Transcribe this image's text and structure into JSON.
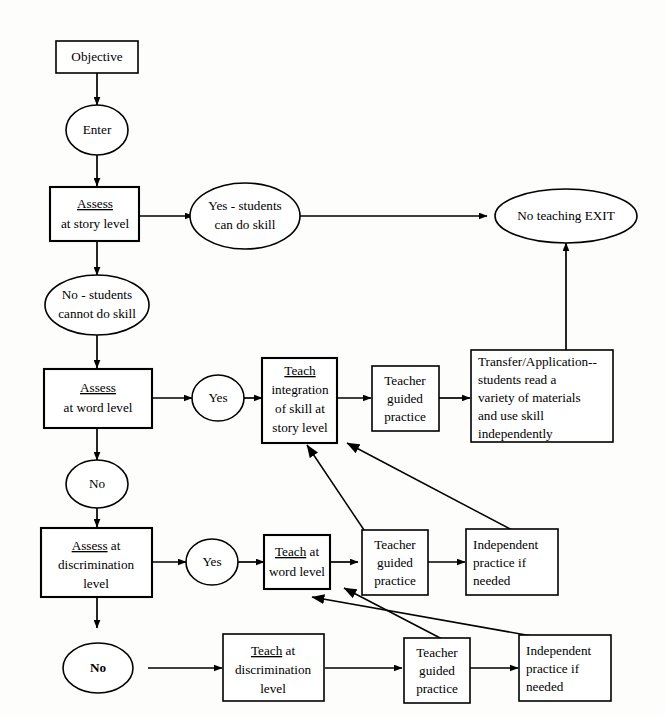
{
  "diagram": {
    "background_color": "#fdfdfb",
    "line_color": "#000000",
    "node_fill": "#ffffff"
  },
  "nodes": {
    "objective": {
      "label": "Objective",
      "shape": "rectangle"
    },
    "enter": {
      "label": "Enter",
      "shape": "ellipse"
    },
    "assess_story": {
      "line1": "Assess",
      "line2": "at story level",
      "shape": "rectangle",
      "underlined": "Assess"
    },
    "yes_students_can": {
      "line1": "Yes - students",
      "line2": "can do skill",
      "shape": "ellipse"
    },
    "no_teaching_exit": {
      "label": "No teaching EXIT",
      "shape": "ellipse"
    },
    "no_students_cannot": {
      "line1": "No - students",
      "line2": "cannot do skill",
      "shape": "ellipse"
    },
    "assess_word": {
      "line1": "Assess",
      "line2": "at word level",
      "shape": "rectangle",
      "underlined": "Assess"
    },
    "yes_word": {
      "label": "Yes",
      "shape": "ellipse"
    },
    "teach_integration": {
      "line1": "Teach",
      "line2": "integration",
      "line3": "of skill at",
      "line4": "story level",
      "shape": "rectangle",
      "underlined": "Teach"
    },
    "teacher_guided_story": {
      "line1": "Teacher",
      "line2": "guided",
      "line3": "practice",
      "shape": "rectangle"
    },
    "transfer_application": {
      "line1": "Transfer/Application--",
      "line2": "students read a",
      "line3": "variety of materials",
      "line4": "and use  skill",
      "line5": "independently",
      "shape": "rectangle"
    },
    "no_word": {
      "label": "No",
      "shape": "ellipse"
    },
    "assess_discrimination": {
      "line1": "Assess at",
      "line2": "discrimination",
      "line3": "level",
      "shape": "rectangle",
      "underlined": "Assess"
    },
    "yes_discrimination": {
      "label": "Yes",
      "shape": "ellipse"
    },
    "teach_word": {
      "line1": "Teach at",
      "line2": "word level",
      "shape": "rectangle",
      "underlined": "Teach"
    },
    "teacher_guided_word": {
      "line1": "Teacher",
      "line2": "guided",
      "line3": "practice",
      "shape": "rectangle"
    },
    "independent_word": {
      "line1": "Independent",
      "line2": "practice if",
      "line3": "needed",
      "shape": "rectangle"
    },
    "no_discrimination": {
      "label": "No",
      "shape": "ellipse",
      "bold": true
    },
    "teach_discrimination": {
      "line1": "Teach at",
      "line2": "discrimination",
      "line3": "level",
      "shape": "rectangle",
      "underlined": "Teach"
    },
    "teacher_guided_discrimination": {
      "line1": "Teacher",
      "line2": "guided",
      "line3": "practice",
      "shape": "rectangle"
    },
    "independent_discrimination": {
      "line1": "Independent",
      "line2": "practice if",
      "line3": "needed",
      "shape": "rectangle"
    }
  },
  "edges": [
    {
      "from": "objective",
      "to": "enter",
      "kind": "vertical-arrow"
    },
    {
      "from": "enter",
      "to": "assess_story",
      "kind": "vertical-arrow"
    },
    {
      "from": "assess_story",
      "to": "yes_students_can",
      "kind": "horizontal-arrow"
    },
    {
      "from": "yes_students_can",
      "to": "no_teaching_exit",
      "kind": "horizontal-arrow"
    },
    {
      "from": "assess_story",
      "to": "no_students_cannot",
      "kind": "vertical-arrow"
    },
    {
      "from": "no_students_cannot",
      "to": "assess_word",
      "kind": "vertical-arrow"
    },
    {
      "from": "assess_word",
      "to": "yes_word",
      "kind": "horizontal-arrow"
    },
    {
      "from": "yes_word",
      "to": "teach_integration",
      "kind": "horizontal-arrow"
    },
    {
      "from": "teach_integration",
      "to": "teacher_guided_story",
      "kind": "horizontal-arrow"
    },
    {
      "from": "teacher_guided_story",
      "to": "transfer_application",
      "kind": "horizontal-arrow"
    },
    {
      "from": "transfer_application",
      "to": "no_teaching_exit",
      "kind": "vertical-arrow"
    },
    {
      "from": "assess_word",
      "to": "no_word",
      "kind": "vertical-arrow"
    },
    {
      "from": "no_word",
      "to": "assess_discrimination",
      "kind": "vertical-arrow"
    },
    {
      "from": "assess_discrimination",
      "to": "yes_discrimination",
      "kind": "horizontal-arrow"
    },
    {
      "from": "yes_discrimination",
      "to": "teach_word",
      "kind": "horizontal-arrow"
    },
    {
      "from": "teach_word",
      "to": "teacher_guided_word",
      "kind": "horizontal-arrow"
    },
    {
      "from": "teacher_guided_word",
      "to": "independent_word",
      "kind": "horizontal-arrow"
    },
    {
      "from": "teacher_guided_word",
      "to": "teach_integration",
      "kind": "diagonal-arrow"
    },
    {
      "from": "independent_word",
      "to": "teach_integration",
      "kind": "diagonal-arrow"
    },
    {
      "from": "assess_discrimination",
      "to": "no_discrimination",
      "kind": "vertical-arrow"
    },
    {
      "from": "no_discrimination",
      "to": "teach_discrimination",
      "kind": "horizontal-arrow"
    },
    {
      "from": "teach_discrimination",
      "to": "teacher_guided_discrimination",
      "kind": "horizontal-arrow"
    },
    {
      "from": "teacher_guided_discrimination",
      "to": "independent_discrimination",
      "kind": "horizontal-arrow"
    },
    {
      "from": "teacher_guided_discrimination",
      "to": "teach_word",
      "kind": "diagonal-arrow"
    },
    {
      "from": "independent_discrimination",
      "to": "teach_word",
      "kind": "diagonal-arrow"
    }
  ]
}
